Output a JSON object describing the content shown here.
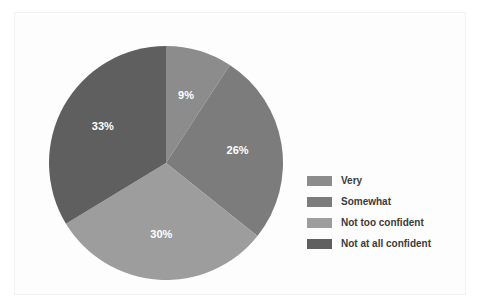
{
  "chart_data": {
    "type": "pie",
    "title": "",
    "subtitle": "",
    "xlabel": "",
    "ylabel": "",
    "grid": false,
    "legend_position": "right",
    "start_angle_deg": 0,
    "direction": "clockwise",
    "categories": [
      "Very",
      "Somewhat",
      "Not too confident",
      "Not at all confident"
    ],
    "values": [
      9,
      26,
      30,
      33
    ],
    "value_unit": "%",
    "data_labels": [
      "9%",
      "26%",
      "30%",
      "33%"
    ],
    "colors": [
      "#8c8c8c",
      "#7c7c7c",
      "#9d9d9d",
      "#5f5f5f"
    ],
    "slices": [
      {
        "label": "Very",
        "value": 9,
        "display": "9%",
        "color": "#8c8c8c"
      },
      {
        "label": "Somewhat",
        "value": 26,
        "display": "26%",
        "color": "#7c7c7c"
      },
      {
        "label": "Not too confident",
        "value": 30,
        "display": "30%",
        "color": "#9d9d9d"
      },
      {
        "label": "Not at all confident",
        "value": 33,
        "display": "33%",
        "color": "#5f5f5f"
      }
    ]
  },
  "legend": {
    "items": [
      {
        "label": "Very",
        "color": "#8c8c8c"
      },
      {
        "label": "Somewhat",
        "color": "#7c7c7c"
      },
      {
        "label": "Not too confident",
        "color": "#9d9d9d"
      },
      {
        "label": "Not at all confident",
        "color": "#5f5f5f"
      }
    ]
  },
  "labels": {
    "slice_0": "9%",
    "slice_1": "26%",
    "slice_2": "30%",
    "slice_3": "33%"
  }
}
